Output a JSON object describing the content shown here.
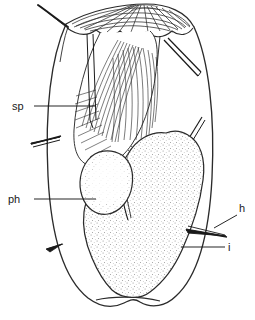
{
  "figure": {
    "kind": "scientific-line-drawing",
    "view": "whole body, internal organs",
    "background_color": "#ffffff",
    "ink_color": "#1a1a1a",
    "stipple_color": "#7a7a7a",
    "line_color": "#2b2b2b"
  },
  "labels": [
    {
      "id": "sp",
      "text": "sp",
      "meaning": "spermatheca",
      "x": 12,
      "y": 110,
      "leader_from": [
        34,
        106
      ],
      "leader_to": [
        96,
        106
      ]
    },
    {
      "id": "ph",
      "text": "ph",
      "meaning": "pharynx",
      "x": 8,
      "y": 203,
      "leader_from": [
        34,
        199
      ],
      "leader_to": [
        96,
        199
      ]
    },
    {
      "id": "h",
      "text": "h",
      "meaning": "hair / seta",
      "x": 239,
      "y": 212,
      "leader_from": [
        237,
        215
      ],
      "leader_to": [
        214,
        227
      ]
    },
    {
      "id": "i",
      "text": "i",
      "meaning": "intestine",
      "x": 228,
      "y": 251,
      "leader_from": [
        225,
        247
      ],
      "leader_to": [
        181,
        247
      ]
    }
  ],
  "structures": [
    {
      "name": "body-outline",
      "description": "oval body wall, narrowed at posterior"
    },
    {
      "name": "anterior-plate",
      "description": "fan-shaped striated cuticular plate at anterior margin"
    },
    {
      "name": "spermatheca",
      "description": "elongate fibrous striated organ, upper left-centre"
    },
    {
      "name": "spermathecal-duct",
      "description": "pair of parallel longitudinal lines"
    },
    {
      "name": "pharynx",
      "description": "rounded stippled bulb"
    },
    {
      "name": "intestine",
      "description": "large stippled lobed mass filling posterior"
    },
    {
      "name": "marginal-setae",
      "description": "bristles on left, right and anterior margins"
    },
    {
      "name": "internal-setae",
      "description": "slender paired line bristles inside body cavity"
    }
  ]
}
